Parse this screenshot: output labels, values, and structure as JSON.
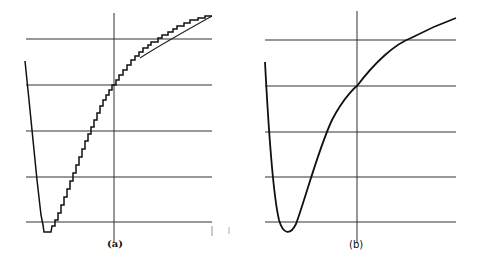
{
  "figure": {
    "panels": [
      {
        "id": "a",
        "label": "(a)",
        "description": "Potential energy curve with stepped (quantized/discretized) approximation",
        "style": "staircase"
      },
      {
        "id": "b",
        "label": "(b)",
        "description": "Smooth potential energy curve",
        "style": "smooth"
      }
    ],
    "gridlines_count": 5,
    "colors": {
      "line": "#1a1a1a",
      "grid": "#333333",
      "background": "#ffffff"
    }
  }
}
